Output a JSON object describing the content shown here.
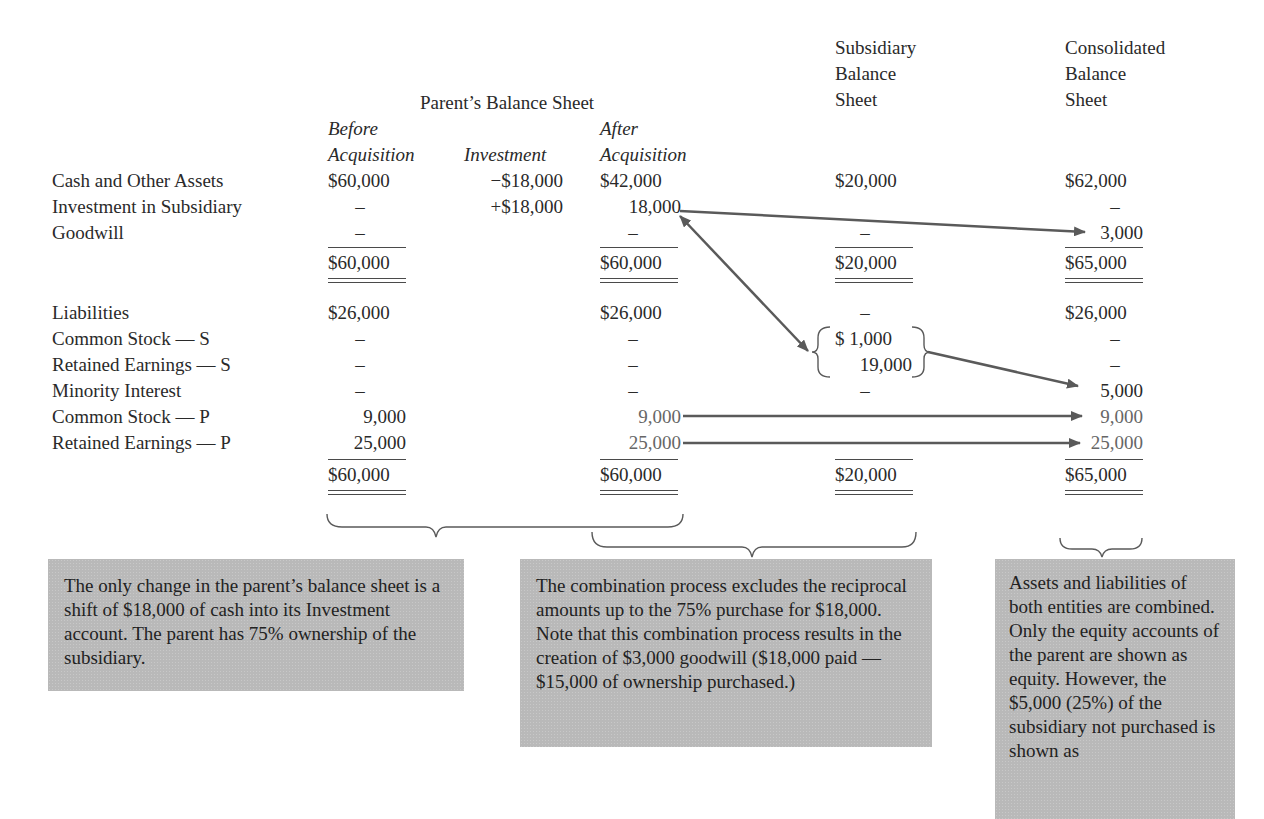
{
  "headers": {
    "parent": "Parent’s Balance Sheet",
    "before": [
      "Before",
      "Acquisition"
    ],
    "investment": "Investment",
    "after": [
      "After",
      "Acquisition"
    ],
    "subsidiary": [
      "Subsidiary",
      "Balance",
      "Sheet"
    ],
    "consolidated": [
      "Consolidated",
      "Balance",
      "Sheet"
    ]
  },
  "rows": [
    {
      "label": "Cash and Other Assets",
      "before": "$60,000",
      "investment": "−$18,000",
      "after": "$42,000",
      "subsidiary": "$20,000",
      "consolidated": "$62,000"
    },
    {
      "label": "Investment in Subsidiary",
      "before": "–",
      "investment": "+$18,000",
      "after": "18,000",
      "subsidiary": "",
      "consolidated": "–"
    },
    {
      "label": "Goodwill",
      "before": "–",
      "investment": "",
      "after": "–",
      "subsidiary": "–",
      "consolidated": "3,000"
    },
    {
      "label": "",
      "before": "$60,000",
      "investment": "",
      "after": "$60,000",
      "subsidiary": "$20,000",
      "consolidated": "$65,000"
    },
    {
      "label": "Liabilities",
      "before": "$26,000",
      "investment": "",
      "after": "$26,000",
      "subsidiary": "–",
      "consolidated": "$26,000"
    },
    {
      "label": "Common Stock — S",
      "before": "–",
      "investment": "",
      "after": "–",
      "subsidiary": "$ 1,000",
      "consolidated": "–"
    },
    {
      "label": "Retained Earnings — S",
      "before": "–",
      "investment": "",
      "after": "–",
      "subsidiary": "19,000",
      "consolidated": "–"
    },
    {
      "label": "Minority Interest",
      "before": "–",
      "investment": "",
      "after": "–",
      "subsidiary": "–",
      "consolidated": "5,000"
    },
    {
      "label": "Common Stock — P",
      "before": "9,000",
      "investment": "",
      "after": "9,000",
      "subsidiary": "",
      "consolidated": "9,000"
    },
    {
      "label": "Retained Earnings — P",
      "before": "25,000",
      "investment": "",
      "after": "25,000",
      "subsidiary": "–",
      "consolidated": "25,000"
    },
    {
      "label": "",
      "before": "$60,000",
      "investment": "",
      "after": "$60,000",
      "subsidiary": "$20,000",
      "consolidated": "$65,000"
    }
  ],
  "notes": {
    "parent": "The only change in the parent’s balance sheet is a shift of $18,000 of cash into its Investment account. The parent has 75% ownership of the subsidiary.",
    "combination": "The combination process excludes the reciprocal amounts up to the 75% purchase for $18,000. Note that this combination process results in the creation of $3,000 goodwill ($18,000 paid — $15,000 of ownership purchased.)",
    "consolidated": "Assets and liabilities of both entities are combined. Only the equity accounts of the parent are shown as equity. However, the $5,000 (25%) of the subsidiary not purchased is shown as"
  },
  "colors": {
    "text": "#2a2a2a",
    "arrow": "#5a5a5a",
    "note_bg": "#b9b9b9",
    "faded_text": "#666666"
  }
}
